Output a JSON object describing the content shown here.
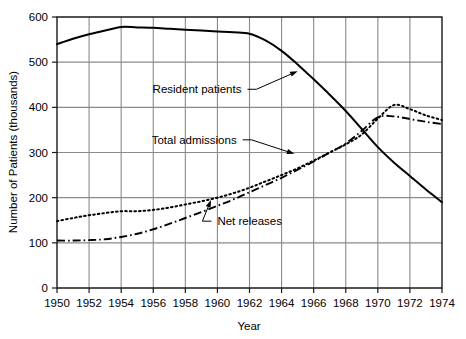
{
  "chart_data": {
    "type": "line",
    "title": "",
    "xlabel": "Year",
    "ylabel": "Number of Patients (thousands)",
    "xlim": [
      1950,
      1974
    ],
    "ylim": [
      0,
      600
    ],
    "grid": true,
    "legend_position": "inline-annotations",
    "x": [
      1950,
      1951,
      1952,
      1953,
      1954,
      1955,
      1956,
      1957,
      1958,
      1959,
      1960,
      1961,
      1962,
      1963,
      1964,
      1965,
      1966,
      1967,
      1968,
      1969,
      1970,
      1971,
      1972,
      1973,
      1974
    ],
    "xticks": [
      "1950",
      "1952",
      "1954",
      "1956",
      "1958",
      "1960",
      "1962",
      "1964",
      "1966",
      "1968",
      "1970",
      "1972",
      "1974"
    ],
    "yticks": [
      "0",
      "100",
      "200",
      "300",
      "400",
      "500",
      "600"
    ],
    "series": [
      {
        "name": "Resident patients",
        "style": "solid",
        "values": [
          540,
          552,
          562,
          570,
          578,
          577,
          576,
          574,
          572,
          570,
          568,
          566,
          563,
          548,
          525,
          495,
          462,
          428,
          392,
          352,
          312,
          278,
          248,
          218,
          190
        ]
      },
      {
        "name": "Total admissions",
        "style": "dotted",
        "values": [
          148,
          155,
          161,
          166,
          170,
          170,
          173,
          178,
          185,
          192,
          200,
          210,
          222,
          236,
          250,
          265,
          282,
          300,
          318,
          340,
          375,
          405,
          396,
          382,
          372
        ]
      },
      {
        "name": "Net releases",
        "style": "dash-dot",
        "values": [
          105,
          105,
          106,
          108,
          113,
          120,
          130,
          142,
          155,
          168,
          182,
          196,
          212,
          228,
          244,
          262,
          280,
          300,
          320,
          348,
          378,
          380,
          374,
          368,
          363
        ]
      }
    ],
    "annotations": [
      {
        "label": "Resident patients",
        "target_series": "Resident patients",
        "text_x": 1961.5,
        "text_y": 440,
        "point_x": 1965.0,
        "point_y": 480
      },
      {
        "label": "Total admissions",
        "target_series": "Total admissions",
        "text_x": 1961.2,
        "text_y": 328,
        "point_x": 1964.8,
        "point_y": 297
      },
      {
        "label": "Net releases",
        "target_series": "Net releases",
        "text_x": 1960.0,
        "text_y": 148,
        "point_x": 1959.6,
        "point_y": 195
      }
    ]
  },
  "colors": {
    "line": "#000000",
    "grid": "#8a8a8a",
    "axis": "#1a1a1a",
    "background": "#ffffff"
  }
}
